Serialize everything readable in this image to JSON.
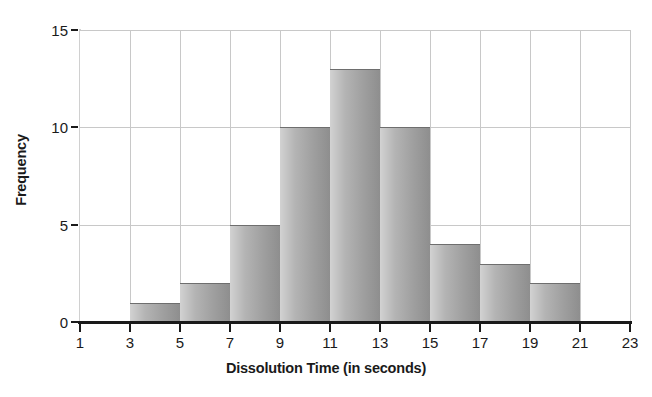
{
  "chart_data": {
    "type": "bar",
    "title": "",
    "xlabel": "Dissolution Time (in seconds)",
    "ylabel": "Frequency",
    "bin_edges": [
      3,
      5,
      7,
      9,
      11,
      13,
      15,
      17,
      19,
      21
    ],
    "categories": [
      "3-5",
      "5-7",
      "7-9",
      "9-11",
      "11-13",
      "13-15",
      "15-17",
      "17-19",
      "19-21"
    ],
    "values": [
      1,
      2,
      5,
      10,
      13,
      10,
      4,
      3,
      2
    ],
    "xlim": [
      1,
      23
    ],
    "ylim": [
      0,
      15
    ],
    "xticks": [
      1,
      3,
      5,
      7,
      9,
      11,
      13,
      15,
      17,
      19,
      21,
      23
    ],
    "xtick_labels": [
      "1",
      "3",
      "5",
      "7",
      "9",
      "11",
      "13",
      "15",
      "17",
      "19",
      "21",
      "23"
    ],
    "yticks": [
      0,
      5,
      10,
      15
    ],
    "ytick_labels": [
      "0",
      "5",
      "10",
      "15"
    ],
    "grid": true,
    "legend": "none",
    "bar_color": "#a8a8a8",
    "bar_edge_color": "#6e6e6e",
    "grid_color": "#c8c8c8",
    "axis_color": "#1a1a1a",
    "background_color": "#ffffff"
  }
}
